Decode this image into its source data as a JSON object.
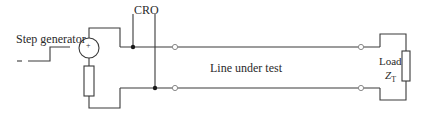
{
  "diagram": {
    "type": "circuit",
    "labels": {
      "step_generator": "Step generator",
      "cro": "CRO",
      "line": "Line under test",
      "load": "Load",
      "load_impedance_symbol": "Z",
      "load_impedance_subscript": "T",
      "source_polarity": "+"
    },
    "colors": {
      "wire": "#3a3a3a",
      "text": "#2a2a2a",
      "background": "#ffffff"
    },
    "components": [
      {
        "id": "step-generator-source",
        "kind": "voltage-source"
      },
      {
        "id": "source-resistor",
        "kind": "resistor"
      },
      {
        "id": "cro-probe-top",
        "kind": "junction"
      },
      {
        "id": "cro-probe-bottom",
        "kind": "junction"
      },
      {
        "id": "line-terminal-left-top",
        "kind": "terminal"
      },
      {
        "id": "line-terminal-left-bottom",
        "kind": "terminal"
      },
      {
        "id": "line-terminal-right-top",
        "kind": "terminal"
      },
      {
        "id": "line-terminal-right-bottom",
        "kind": "terminal"
      },
      {
        "id": "load-impedance",
        "kind": "resistor"
      }
    ]
  }
}
